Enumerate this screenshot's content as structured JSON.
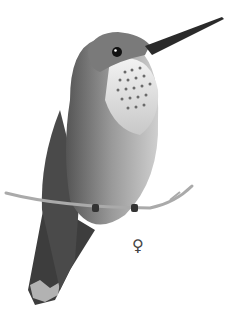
{
  "image": {
    "subject": "Female hummingbird perched on a twig, grayscale pencil illustration",
    "sex_symbol": "♀",
    "colors": {
      "background": "#ffffff",
      "body_dark": "#3a3a3a",
      "body_mid": "#8a8a8a",
      "body_light": "#d8d8d8",
      "bill": "#2a2a2a",
      "twig": "#b5b5b5"
    }
  }
}
